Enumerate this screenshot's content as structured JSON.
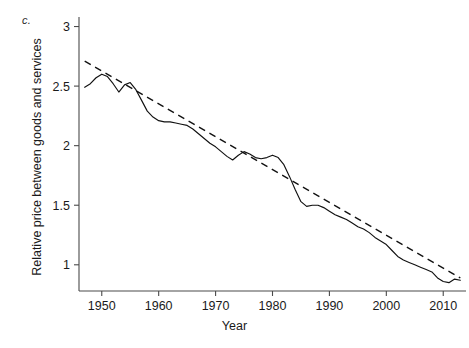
{
  "figure": {
    "panel_label": "c.",
    "background_color": "#ffffff",
    "ink_color": "#111111"
  },
  "chart_data": {
    "type": "line",
    "title": "",
    "subtitle": "",
    "xlabel": "Year",
    "ylabel": "Relative price between goods and services",
    "xlim": [
      1946,
      2014
    ],
    "ylim": [
      0.78,
      3.08
    ],
    "xticks": [
      1950,
      1960,
      1970,
      1980,
      1990,
      2000,
      2010
    ],
    "xticklabels": [
      "1950",
      "1960",
      "1970",
      "1980",
      "1990",
      "2000",
      "2010"
    ],
    "yticks": [
      1,
      1.5,
      2,
      2.5,
      3
    ],
    "yticklabels": [
      "1",
      "1.5",
      "2",
      "2.5",
      "3"
    ],
    "grid": false,
    "legend": "none",
    "annotations": [
      {
        "text": "c.",
        "role": "panel-label",
        "position": "top-left-outside"
      }
    ],
    "series": [
      {
        "name": "Relative price between goods and services",
        "style": "solid",
        "x": [
          1947,
          1948,
          1949,
          1950,
          1951,
          1952,
          1953,
          1954,
          1955,
          1956,
          1957,
          1958,
          1959,
          1960,
          1961,
          1962,
          1963,
          1964,
          1965,
          1966,
          1967,
          1968,
          1969,
          1970,
          1971,
          1972,
          1973,
          1974,
          1975,
          1976,
          1977,
          1978,
          1979,
          1980,
          1981,
          1982,
          1983,
          1984,
          1985,
          1986,
          1987,
          1988,
          1989,
          1990,
          1991,
          1992,
          1993,
          1994,
          1995,
          1996,
          1997,
          1998,
          1999,
          2000,
          2001,
          2002,
          2003,
          2004,
          2005,
          2006,
          2007,
          2008,
          2009,
          2010,
          2011,
          2012,
          2013
        ],
        "values": [
          2.49,
          2.52,
          2.57,
          2.6,
          2.58,
          2.52,
          2.45,
          2.51,
          2.53,
          2.47,
          2.38,
          2.29,
          2.24,
          2.21,
          2.2,
          2.2,
          2.19,
          2.18,
          2.17,
          2.14,
          2.1,
          2.06,
          2.02,
          1.99,
          1.95,
          1.91,
          1.88,
          1.92,
          1.95,
          1.93,
          1.9,
          1.89,
          1.9,
          1.92,
          1.9,
          1.84,
          1.74,
          1.63,
          1.53,
          1.49,
          1.5,
          1.5,
          1.48,
          1.45,
          1.42,
          1.4,
          1.38,
          1.35,
          1.32,
          1.3,
          1.27,
          1.23,
          1.2,
          1.17,
          1.12,
          1.07,
          1.04,
          1.02,
          1.0,
          0.98,
          0.96,
          0.94,
          0.89,
          0.86,
          0.85,
          0.88,
          0.87
        ]
      },
      {
        "name": "Linear trend",
        "style": "dashed",
        "x": [
          1947,
          2013
        ],
        "values": [
          2.71,
          0.89
        ]
      }
    ]
  }
}
